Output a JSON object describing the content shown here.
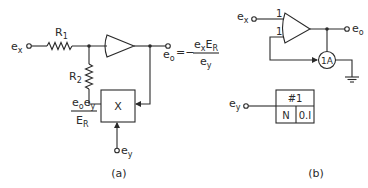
{
  "diagram_a": {
    "input_label": "e",
    "input_sub": "x",
    "r1_label": "R",
    "r1_sub": "1",
    "r2_label": "R",
    "r2_sub": "2",
    "multiplier_label": "X",
    "output_label": "e",
    "output_sub": "o",
    "equation_equals": "=−",
    "equation_num_a": "e",
    "equation_num_a_sub": "x",
    "equation_num_b": "E",
    "equation_num_b_sub": "R",
    "equation_den": "e",
    "equation_den_sub": "y",
    "feedback_num_a": "e",
    "feedback_num_a_sub": "o",
    "feedback_num_b": "e",
    "feedback_num_b_sub": "y",
    "feedback_den": "E",
    "feedback_den_sub": "R",
    "ey_label": "e",
    "ey_sub": "y",
    "caption": "(a)"
  },
  "diagram_b": {
    "input_label": "e",
    "input_sub": "x",
    "gain_in1": "1",
    "gain_in2": "1",
    "output_label": "e",
    "output_sub": "o",
    "multiplier_label": "1A",
    "box_title": "#1",
    "box_cell_left": "N",
    "box_cell_right": "0.I",
    "ey_label": "e",
    "ey_sub": "y",
    "caption": "(b)"
  }
}
